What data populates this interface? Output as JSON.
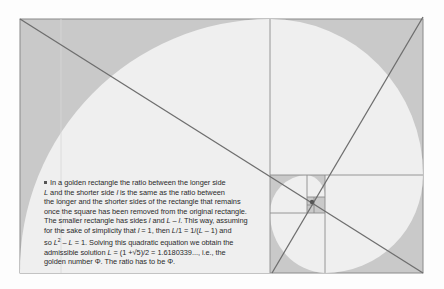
{
  "figure": {
    "colors": {
      "background": "#fdfdfd",
      "rectangle_fill": "#c9c9c9",
      "arc_fill": "#efefef",
      "lines": "#7a7a7a",
      "diagonals": "#6e6e6e"
    }
  },
  "caption": {
    "bullet": "■",
    "line1": "In a golden rectangle the ratio between the longer side",
    "line2_a": "L",
    "line2_b": " and the shorter side ",
    "line2_c": "l",
    "line2_d": " is the same as the ratio between",
    "line3": "the longer and the shorter sides of the rectangle that remains",
    "line4": "once the square has been removed from the original rectangle.",
    "line5_a": "The smaller rectangle has sides ",
    "line5_b": "l",
    "line5_c": " and ",
    "line5_d": "L – l",
    "line5_e": ". This way, assuming",
    "line6_a": "for the sake of simplicity that ",
    "line6_b": "l",
    "line6_c": " = 1, then ",
    "line6_d": "L",
    "line6_e": "/1 = 1/(",
    "line6_f": "L",
    "line6_g": " – 1) and",
    "line7_a": "so ",
    "line7_b": "L",
    "line7_sup": "2",
    "line7_c": " – ",
    "line7_d": "L",
    "line7_e": " = 1. Solving this quadratic equation we obtain the",
    "line8_a": "admissible solution ",
    "line8_b": "L",
    "line8_c": " = (1 +√5)/2 = 1.6180339..., i.e., the",
    "line9": "golden number Φ. The ratio has to be Φ."
  }
}
